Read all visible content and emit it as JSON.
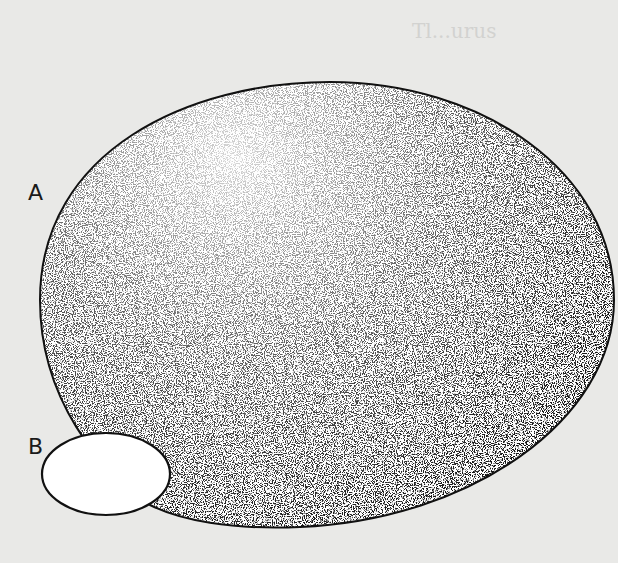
{
  "figure": {
    "type": "stippled-ellipse-illustration",
    "background_color": "#e9e9e7",
    "labels": [
      {
        "id": "A",
        "text": "A",
        "x": 28,
        "y": 188
      },
      {
        "id": "B",
        "text": "B",
        "x": 28,
        "y": 440
      }
    ],
    "shapes": [
      {
        "id": "A",
        "kind": "large-ellipse",
        "fill": "stipple",
        "stroke": "#111111",
        "cx": 326,
        "cy": 301,
        "rx": 292,
        "ry": 220
      },
      {
        "id": "B",
        "kind": "small-ellipse",
        "fill": "#ffffff",
        "stroke": "#111111",
        "cx": 106,
        "cy": 474,
        "rx": 64,
        "ry": 41
      }
    ],
    "bleed_through_text": {
      "heading": "Tl...urus"
    }
  }
}
